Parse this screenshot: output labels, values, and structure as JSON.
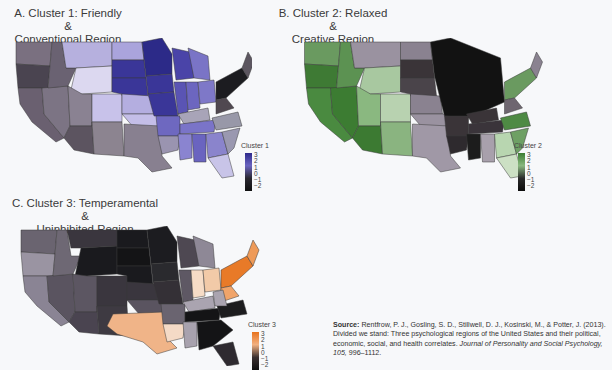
{
  "panels": [
    {
      "id": "A",
      "title_line1": "A. Cluster 1: Friendly &",
      "title_line2": "Conventional Region",
      "legend_title": "Cluster 1",
      "legend_ticks": [
        "3",
        "2",
        "1",
        "0",
        "−1",
        "−2"
      ],
      "high_color": "#2e2a8c",
      "mid_color": "#a8a3d6",
      "low_color": "#1a1a1a"
    },
    {
      "id": "B",
      "title_line1": "B. Cluster 2: Relaxed &",
      "title_line2": "Creative Region",
      "legend_title": "Cluster 2",
      "legend_ticks": [
        "3",
        "2",
        "1",
        "0",
        "−1",
        "−2"
      ],
      "high_color": "#3c7d32",
      "mid_color": "#a9c9a0",
      "low_color": "#141414"
    },
    {
      "id": "C",
      "title_line1": "C. Cluster 3: Temperamental &",
      "title_line2": "Uninhibited Region",
      "legend_title": "Cluster 3",
      "legend_ticks": [
        "3",
        "2",
        "1",
        "0",
        "−1",
        "−2"
      ],
      "high_color": "#e8731e",
      "mid_color": "#f2c4a0",
      "low_color": "#1a1a1a"
    }
  ],
  "source": {
    "label": "Source:",
    "text1": " Rentfrow, P. J., Gosling, S. D., Stillwell, D. J., Kosinski, M., & Potter, J. (2013). Divided we stand: Three psychological regions of the United States and their political, economic, social, and health correlates. ",
    "journal": "Journal of Personality and Social Psychology, 105,",
    "text2": " 996–1112."
  }
}
